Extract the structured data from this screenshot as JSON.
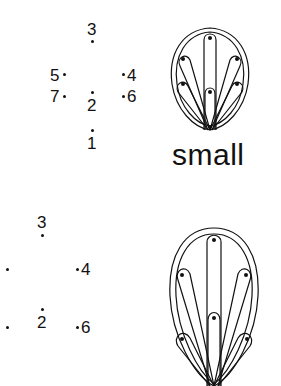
{
  "figure": {
    "top_panel": {
      "label": "small",
      "points": [
        {
          "id": "1",
          "label": "1"
        },
        {
          "id": "2",
          "label": "2"
        },
        {
          "id": "3",
          "label": "3"
        },
        {
          "id": "4",
          "label": "4"
        },
        {
          "id": "5",
          "label": "5"
        },
        {
          "id": "6",
          "label": "6"
        },
        {
          "id": "7",
          "label": "7"
        }
      ]
    },
    "bottom_panel": {
      "points": [
        {
          "id": "2",
          "label": "2"
        },
        {
          "id": "3",
          "label": "3"
        },
        {
          "id": "4",
          "label": "4"
        },
        {
          "id": "6",
          "label": "6"
        }
      ]
    },
    "stroke_color": "#111111",
    "background_color": "#ffffff"
  }
}
